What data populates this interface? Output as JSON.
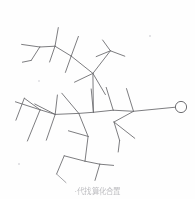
{
  "figure": {
    "kind": "skeletal-structure-diagram",
    "width": 195,
    "height": 199,
    "background_color": "#fefefe",
    "line_color": "#6e6e72",
    "faint_line_color": "#8d8d92",
    "terminal_group_label": "open-circle-terminal",
    "terminal_circle": {
      "cx": 181,
      "cy": 107,
      "r": 5.6
    }
  },
  "caption": {
    "text": "·代找算化合置",
    "legible": false,
    "note_color": "#b4b4b8"
  },
  "chart_data": {
    "type": "diagram",
    "title": "",
    "nodes": [
      {
        "id": "n1",
        "x": 181,
        "y": 107,
        "label": "terminal-circle"
      },
      {
        "id": "n2",
        "x": 133,
        "y": 111,
        "label": "junction"
      },
      {
        "id": "n3",
        "x": 113,
        "y": 110,
        "label": "junction"
      },
      {
        "id": "n4",
        "x": 93,
        "y": 112,
        "label": "junction"
      },
      {
        "id": "n5",
        "x": 79,
        "y": 113,
        "label": "junction"
      },
      {
        "id": "n6",
        "x": 55,
        "y": 114,
        "label": "junction"
      },
      {
        "id": "n7",
        "x": 40,
        "y": 110,
        "label": "junction"
      },
      {
        "id": "n8",
        "x": 93,
        "y": 73,
        "label": "junction"
      },
      {
        "id": "n9",
        "x": 71,
        "y": 56,
        "label": "junction"
      },
      {
        "id": "n10",
        "x": 55,
        "y": 46,
        "label": "junction"
      },
      {
        "id": "n11",
        "x": 40,
        "y": 47,
        "label": "junction"
      },
      {
        "id": "n12",
        "x": 88,
        "y": 136,
        "label": "junction"
      },
      {
        "id": "n13",
        "x": 85,
        "y": 161,
        "label": "junction"
      },
      {
        "id": "n14",
        "x": 114,
        "y": 122,
        "label": "junction"
      }
    ],
    "edges": [
      [
        "n1",
        "n2"
      ],
      [
        "n2",
        "n3"
      ],
      [
        "n3",
        "n4"
      ],
      [
        "n4",
        "n5"
      ],
      [
        "n5",
        "n6"
      ],
      [
        "n6",
        "n7"
      ],
      [
        "n4",
        "n8"
      ],
      [
        "n8",
        "n9"
      ],
      [
        "n9",
        "n10"
      ],
      [
        "n10",
        "n11"
      ],
      [
        "n5",
        "n12"
      ],
      [
        "n12",
        "n13"
      ],
      [
        "n2",
        "n14"
      ]
    ],
    "terminal_count": 24,
    "ylabel": "",
    "xlabel": ""
  }
}
